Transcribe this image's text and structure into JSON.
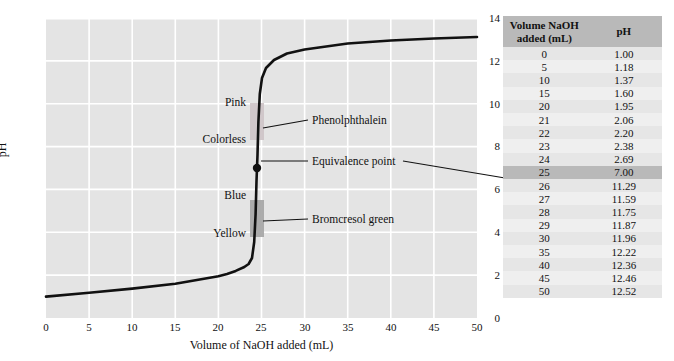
{
  "chart_data": {
    "type": "line",
    "title": "",
    "xlabel": "Volume of NaOH added (mL)",
    "ylabel": "pH",
    "xlim": [
      0,
      50
    ],
    "ylim": [
      0,
      14
    ],
    "xticks": [
      0,
      5,
      10,
      15,
      20,
      25,
      30,
      35,
      40,
      45,
      50
    ],
    "yticks": [
      0,
      2,
      4,
      6,
      8,
      10,
      12,
      14
    ],
    "grid": true,
    "legend": "none",
    "x": [
      0,
      5,
      10,
      15,
      20,
      21,
      22,
      23,
      24,
      25,
      26,
      27,
      28,
      29,
      30,
      35,
      40,
      45,
      50
    ],
    "y": [
      1.0,
      1.18,
      1.37,
      1.6,
      1.95,
      2.06,
      2.2,
      2.38,
      2.69,
      7.0,
      11.29,
      11.59,
      11.75,
      11.87,
      11.96,
      12.22,
      12.36,
      12.46,
      12.52
    ],
    "series": [
      {
        "name": "Titration of strong acid with NaOH",
        "values": [
          1.0,
          1.18,
          1.37,
          1.6,
          1.95,
          2.06,
          2.2,
          2.38,
          2.69,
          7.0,
          11.29,
          11.59,
          11.75,
          11.87,
          11.96,
          12.22,
          12.36,
          12.46,
          12.52
        ]
      }
    ],
    "annotations": [
      {
        "name": "equivalence-point",
        "label": "Equivalence point",
        "x": 25,
        "y": 7.0
      },
      {
        "name": "phenolphthalein",
        "label": "Phenolphthalein",
        "range_ph": [
          8.3,
          10.0
        ],
        "colors": [
          "Colorless",
          "Pink"
        ]
      },
      {
        "name": "bromcresol-green",
        "label": "Bromcresol green",
        "range_ph": [
          3.8,
          5.4
        ],
        "colors": [
          "Yellow",
          "Blue"
        ]
      }
    ],
    "indicator_labels": {
      "pink": "Pink",
      "colorless": "Colorless",
      "blue": "Blue",
      "yellow": "Yellow"
    }
  },
  "table": {
    "headers": {
      "volume": "Volume NaOH added (mL)",
      "volume_line1": "Volume NaOH",
      "volume_line2": "added (mL)",
      "ph": "pH"
    },
    "highlight_row_index": 9,
    "rows": [
      {
        "volume": "0",
        "ph": "1.00"
      },
      {
        "volume": "5",
        "ph": "1.18"
      },
      {
        "volume": "10",
        "ph": "1.37"
      },
      {
        "volume": "15",
        "ph": "1.60"
      },
      {
        "volume": "20",
        "ph": "1.95"
      },
      {
        "volume": "21",
        "ph": "2.06"
      },
      {
        "volume": "22",
        "ph": "2.20"
      },
      {
        "volume": "23",
        "ph": "2.38"
      },
      {
        "volume": "24",
        "ph": "2.69"
      },
      {
        "volume": "25",
        "ph": "7.00"
      },
      {
        "volume": "26",
        "ph": "11.29"
      },
      {
        "volume": "27",
        "ph": "11.59"
      },
      {
        "volume": "28",
        "ph": "11.75"
      },
      {
        "volume": "29",
        "ph": "11.87"
      },
      {
        "volume": "30",
        "ph": "11.96"
      },
      {
        "volume": "35",
        "ph": "12.22"
      },
      {
        "volume": "40",
        "ph": "12.36"
      },
      {
        "volume": "45",
        "ph": "12.46"
      },
      {
        "volume": "50",
        "ph": "12.52"
      }
    ]
  },
  "colors": {
    "plot_background": "#e4e4e4",
    "gridline": "#ffffff",
    "curve": "#000000",
    "phenolphthalein_band": "#cfc5c8",
    "bromcresol_band": "#a8a8a8",
    "table_header": "#b9b9b9",
    "table_row_odd": "#e6e6e6",
    "table_row_even": "#efefef",
    "table_highlight": "#b9b9b9",
    "text": "#111111"
  }
}
